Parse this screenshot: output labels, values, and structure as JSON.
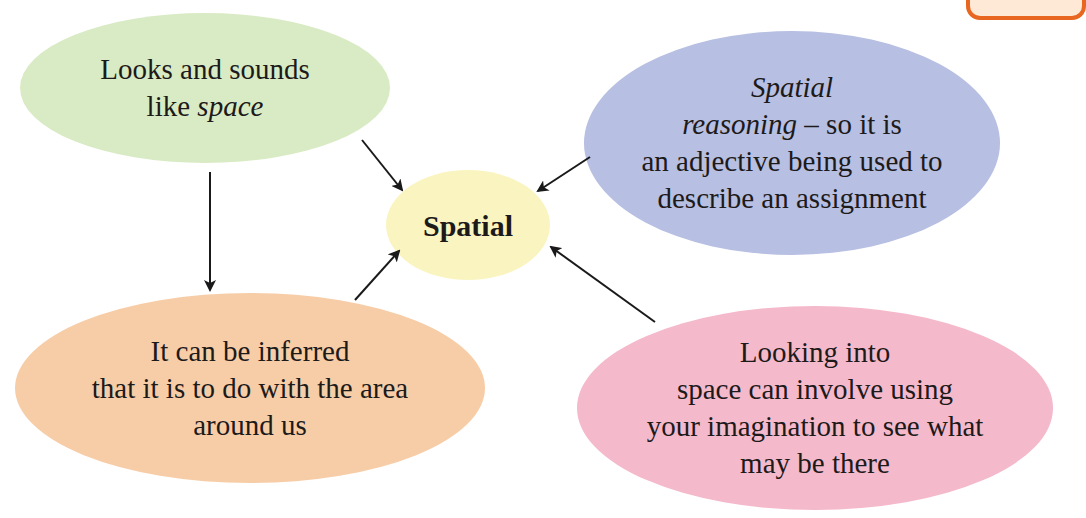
{
  "diagram": {
    "type": "concept-map",
    "center": {
      "label": "Spatial",
      "color": "#faf5c0"
    },
    "nodes": [
      {
        "id": "looks-sounds",
        "lines": [
          "Looks and sounds",
          "like "
        ],
        "italic_tail": "space",
        "color": "#d9ebc4"
      },
      {
        "id": "spatial-reasoning",
        "italic_lines": [
          "Spatial",
          "reasoning"
        ],
        "line2_tail": " – so it is",
        "lines": [
          "an adjective being used to",
          "describe an assignment"
        ],
        "color": "#b7bfe2"
      },
      {
        "id": "inferred-area",
        "lines": [
          "It can be inferred",
          "that it is to do with the area",
          "around us"
        ],
        "color": "#f7cda8"
      },
      {
        "id": "looking-into-space",
        "lines": [
          "Looking into",
          "space can involve using",
          "your imagination to see what",
          "may be there"
        ],
        "color": "#f4b9cb"
      }
    ],
    "edges": [
      {
        "from": "looks-sounds",
        "to": "Spatial"
      },
      {
        "from": "looks-sounds",
        "to": "inferred-area"
      },
      {
        "from": "inferred-area",
        "to": "Spatial"
      },
      {
        "from": "spatial-reasoning",
        "to": "Spatial"
      },
      {
        "from": "looking-into-space",
        "to": "Spatial"
      }
    ],
    "corner_box": {
      "border_color": "#e8661f",
      "fill_color": "#fde9d6"
    }
  }
}
